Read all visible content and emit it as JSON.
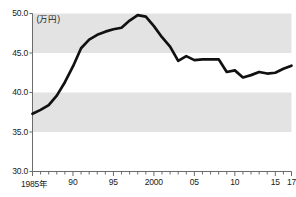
{
  "chart": {
    "unit_label": "(万円)",
    "axis_color": "#6b6b6b",
    "line_color": "#111111",
    "band_color": "#e3e3e3",
    "background": "#ffffff"
  },
  "yaxis": {
    "ticks": [
      "50.0",
      "45.0",
      "40.0",
      "35.0",
      "30.0"
    ]
  },
  "xaxis": {
    "labels": [
      {
        "text": "1985年",
        "year": 1985
      },
      {
        "text": "90",
        "year": 1990
      },
      {
        "text": "95",
        "year": 1995
      },
      {
        "text": "2000",
        "year": 2000
      },
      {
        "text": "05",
        "year": 2005
      },
      {
        "text": "10",
        "year": 2010
      },
      {
        "text": "15",
        "year": 2015
      },
      {
        "text": "17",
        "year": 2017
      }
    ]
  },
  "chart_data": {
    "type": "line",
    "title": "",
    "subtitle": "",
    "xlabel": "",
    "ylabel": "(万円)",
    "ylim": [
      30.0,
      50.0
    ],
    "xlim": [
      1985,
      2017
    ],
    "yticks": [
      30.0,
      35.0,
      40.0,
      45.0,
      50.0
    ],
    "xticks": [
      1985,
      1990,
      1995,
      2000,
      2005,
      2010,
      2015,
      2017
    ],
    "grid": false,
    "banded_background": true,
    "band_ranges": [
      [
        45.0,
        50.0
      ],
      [
        35.0,
        40.0
      ]
    ],
    "legend": null,
    "x": [
      1985,
      1986,
      1987,
      1988,
      1989,
      1990,
      1991,
      1992,
      1993,
      1994,
      1995,
      1996,
      1997,
      1998,
      1999,
      2000,
      2001,
      2002,
      2003,
      2004,
      2005,
      2006,
      2007,
      2008,
      2009,
      2010,
      2011,
      2012,
      2013,
      2014,
      2015,
      2016,
      2017
    ],
    "values": [
      37.3,
      37.8,
      38.4,
      39.6,
      41.3,
      43.3,
      45.6,
      46.7,
      47.3,
      47.7,
      48.0,
      48.2,
      49.1,
      49.8,
      49.6,
      48.4,
      47.0,
      45.8,
      44.0,
      44.6,
      44.1,
      44.2,
      44.2,
      44.2,
      42.6,
      42.8,
      41.9,
      42.2,
      42.6,
      42.4,
      42.5,
      43.0,
      43.4
    ],
    "series": [
      {
        "name": "値",
        "values": [
          37.3,
          37.8,
          38.4,
          39.6,
          41.3,
          43.3,
          45.6,
          46.7,
          47.3,
          47.7,
          48.0,
          48.2,
          49.1,
          49.8,
          49.6,
          48.4,
          47.0,
          45.8,
          44.0,
          44.6,
          44.1,
          44.2,
          44.2,
          44.2,
          42.6,
          42.8,
          41.9,
          42.2,
          42.6,
          42.4,
          42.5,
          43.0,
          43.4
        ]
      }
    ]
  }
}
